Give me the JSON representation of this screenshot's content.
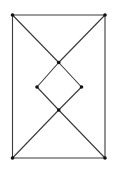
{
  "diagram": {
    "type": "graph",
    "colors": {
      "edge": "#3a3a3a",
      "vertex": "#111111",
      "background": "#ffffff"
    },
    "vertices": [
      {
        "id": "v1",
        "x": 12.5,
        "y": 15
      },
      {
        "id": "v2",
        "x": 105,
        "y": 15
      },
      {
        "id": "v3",
        "x": 58.7,
        "y": 62.5
      },
      {
        "id": "v4",
        "x": 37,
        "y": 87
      },
      {
        "id": "v5",
        "x": 81.5,
        "y": 87
      },
      {
        "id": "v6",
        "x": 58.7,
        "y": 110
      },
      {
        "id": "v7",
        "x": 12.5,
        "y": 158
      },
      {
        "id": "v8",
        "x": 105,
        "y": 158
      }
    ],
    "edges": [
      [
        "v1",
        "v2"
      ],
      [
        "v1",
        "v7"
      ],
      [
        "v2",
        "v8"
      ],
      [
        "v7",
        "v8"
      ],
      [
        "v1",
        "v3"
      ],
      [
        "v2",
        "v3"
      ],
      [
        "v3",
        "v4"
      ],
      [
        "v3",
        "v5"
      ],
      [
        "v4",
        "v6"
      ],
      [
        "v5",
        "v6"
      ],
      [
        "v6",
        "v7"
      ],
      [
        "v6",
        "v8"
      ]
    ]
  }
}
